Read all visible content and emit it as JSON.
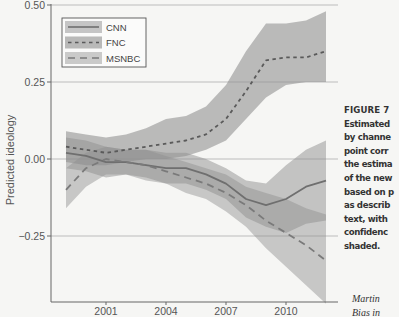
{
  "chart_data": {
    "type": "line",
    "title": "",
    "xlabel": "",
    "ylabel": "Predicted ideology",
    "ylim": [
      -0.45,
      0.5
    ],
    "xlim": [
      1998.25,
      2012.9
    ],
    "grid": "horizontal",
    "yticks": [
      0.5,
      0.25,
      0.0,
      -0.25
    ],
    "ytick_labels": [
      "0.50",
      "0.25",
      "0.00",
      "−0.25"
    ],
    "xticks": [
      2001,
      2004,
      2007,
      2010
    ],
    "xtick_labels": [
      "2001",
      "2004",
      "2007",
      "2010"
    ],
    "legend_position": "upper left",
    "x": [
      1999,
      2000,
      2001,
      2002,
      2003,
      2004,
      2005,
      2006,
      2007,
      2008,
      2009,
      2010,
      2011,
      2012
    ],
    "series": [
      {
        "name": "CNN",
        "line_style": "solid",
        "values": [
          0.02,
          0.01,
          -0.01,
          -0.01,
          -0.02,
          -0.03,
          -0.03,
          -0.05,
          -0.08,
          -0.13,
          -0.15,
          -0.13,
          -0.09,
          -0.07
        ],
        "ci_upper": [
          0.07,
          0.06,
          0.04,
          0.03,
          0.03,
          0.02,
          0.02,
          0.0,
          -0.03,
          -0.07,
          -0.08,
          -0.02,
          0.03,
          0.06
        ],
        "ci_lower": [
          -0.03,
          -0.04,
          -0.06,
          -0.05,
          -0.06,
          -0.08,
          -0.08,
          -0.1,
          -0.13,
          -0.19,
          -0.22,
          -0.24,
          -0.21,
          -0.2
        ],
        "color": "#6f6f6f"
      },
      {
        "name": "FNC",
        "line_style": "dotted",
        "values": [
          0.04,
          0.03,
          0.02,
          0.03,
          0.04,
          0.05,
          0.06,
          0.08,
          0.13,
          0.22,
          0.32,
          0.33,
          0.33,
          0.35
        ],
        "ci_upper": [
          0.09,
          0.08,
          0.07,
          0.08,
          0.1,
          0.13,
          0.14,
          0.17,
          0.24,
          0.35,
          0.44,
          0.44,
          0.45,
          0.48
        ],
        "ci_lower": [
          -0.01,
          -0.02,
          -0.02,
          -0.01,
          0.0,
          0.0,
          0.01,
          0.03,
          0.06,
          0.13,
          0.2,
          0.24,
          0.25,
          0.25
        ],
        "color": "#5a5a5a"
      },
      {
        "name": "MSNBC",
        "line_style": "dashed",
        "values": [
          -0.1,
          -0.03,
          0.0,
          -0.01,
          -0.02,
          -0.04,
          -0.06,
          -0.08,
          -0.11,
          -0.15,
          -0.2,
          -0.24,
          -0.28,
          -0.33
        ],
        "ci_upper": [
          -0.03,
          0.02,
          0.04,
          0.03,
          0.03,
          0.01,
          -0.01,
          -0.03,
          -0.05,
          -0.09,
          -0.11,
          -0.13,
          -0.16,
          -0.18
        ],
        "ci_lower": [
          -0.16,
          -0.09,
          -0.05,
          -0.05,
          -0.07,
          -0.08,
          -0.11,
          -0.13,
          -0.17,
          -0.22,
          -0.29,
          -0.35,
          -0.41,
          -0.47
        ],
        "color": "#7a7a7a"
      }
    ],
    "annotations": []
  },
  "legend": {
    "items": [
      {
        "label": "CNN"
      },
      {
        "label": "FNC"
      },
      {
        "label": "MSNBC"
      }
    ]
  },
  "caption": {
    "figure_label": "FIGURE 7",
    "lines": [
      "Estimated",
      "by channe",
      "point corr",
      "the estima",
      "of the new",
      "based on p",
      "as describ",
      "text, with",
      "confidenc",
      "shaded."
    ],
    "source_lines": [
      "Martin",
      "Bias in"
    ]
  },
  "colors": {
    "background": "#f6f6f4",
    "band": "#8f8f8f",
    "gridline": "#b5b5b5",
    "axis": "#666666"
  }
}
